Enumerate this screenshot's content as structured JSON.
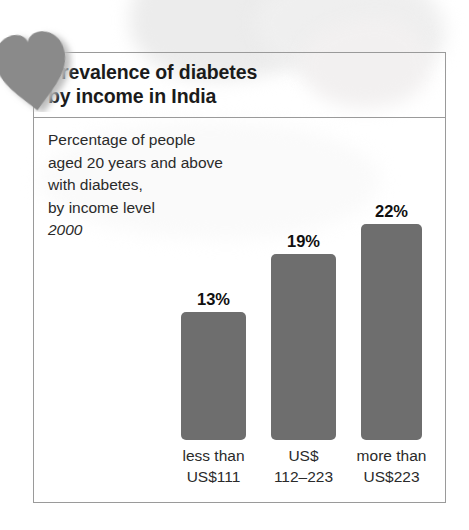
{
  "title": {
    "line1": "Prevalence of diabetes",
    "line2": "by income in India"
  },
  "caption": {
    "line1": "Percentage of people",
    "line2": "aged 20 years and above",
    "line3": "with diabetes,",
    "line4": "by income level",
    "year": "2000"
  },
  "colors": {
    "bar": "#6e6e6e",
    "border": "#9a9a9a",
    "text": "#2a2a2a",
    "heart": "#8a8a8a"
  },
  "icons": {
    "heart": "heart-icon"
  },
  "chart_data": {
    "type": "bar",
    "title": "Prevalence of diabetes by income in India",
    "subtitle": "Percentage of people aged 20 years and above with diabetes, by income level",
    "year": "2000",
    "xlabel": "",
    "ylabel": "Percentage",
    "ylim": [
      0,
      26
    ],
    "grid": false,
    "legend": false,
    "categories": [
      "less than US$111",
      "US$ 112–223",
      "more than US$223"
    ],
    "category_lines": [
      [
        "less than",
        "US$111"
      ],
      [
        "US$",
        "112–223"
      ],
      [
        "more than",
        "US$223"
      ]
    ],
    "values": [
      13,
      19,
      22
    ],
    "value_labels": [
      "13%",
      "19%",
      "22%"
    ]
  }
}
